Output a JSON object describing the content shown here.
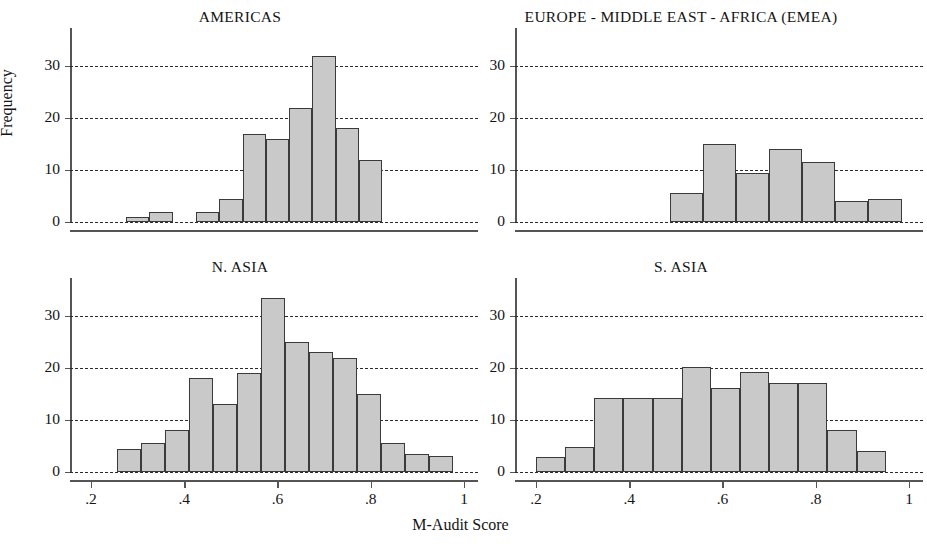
{
  "figure": {
    "xlabel": "M-Audit Score",
    "ylabel": "Frequency"
  },
  "axes": {
    "y_ticks": [
      "0",
      "10",
      "20",
      "30"
    ],
    "x_ticks": [
      ".2",
      ".4",
      ".6",
      ".8",
      "1"
    ],
    "y_tick_values": [
      0,
      10,
      20,
      30
    ],
    "x_tick_values": [
      0.2,
      0.4,
      0.6,
      0.8,
      1.0
    ],
    "ylim": [
      0,
      35
    ],
    "xlim": [
      0.155,
      1.03
    ],
    "grid": "horizontal-dashed",
    "legend": "none"
  },
  "style": {
    "bar_fill": "#c9c9c9",
    "bar_border": "#3a3a3a",
    "grid_color": "#2a2a2a",
    "axis_color": "#555555",
    "text_color": "#141414",
    "background": "#ffffff"
  },
  "chart_data": [
    {
      "type": "bar",
      "title": "AMERICAS",
      "xlabel": "M-Audit Score",
      "ylabel": "Frequency",
      "ylim": [
        0,
        35
      ],
      "xlim": [
        0.155,
        1.03
      ],
      "bin_width": 0.05,
      "bin_starts": [
        0.275,
        0.325,
        0.375,
        0.425,
        0.475,
        0.525,
        0.575,
        0.625,
        0.675,
        0.725,
        0.775
      ],
      "categories": [
        "0.275-0.325",
        "0.325-0.375",
        "0.375-0.425",
        "0.425-0.475",
        "0.475-0.525",
        "0.525-0.575",
        "0.575-0.625",
        "0.625-0.675",
        "0.675-0.725",
        "0.725-0.775",
        "0.775-0.825"
      ],
      "values": [
        1,
        2,
        0,
        2,
        4.5,
        17,
        16,
        22,
        32,
        18,
        12
      ]
    },
    {
      "type": "bar",
      "title": "EUROPE - MIDDLE EAST - AFRICA (EMEA)",
      "xlabel": "M-Audit Score",
      "ylabel": "Frequency",
      "ylim": [
        0,
        35
      ],
      "xlim": [
        0.155,
        1.03
      ],
      "bin_width": 0.071,
      "bin_starts": [
        0.487,
        0.558,
        0.629,
        0.7,
        0.771,
        0.842,
        0.913
      ],
      "categories": [
        "0.49-0.56",
        "0.56-0.63",
        "0.63-0.70",
        "0.70-0.77",
        "0.77-0.84",
        "0.84-0.91",
        "0.91-0.98"
      ],
      "values": [
        5.5,
        15,
        9.5,
        14,
        11.5,
        4,
        4.5
      ]
    },
    {
      "type": "bar",
      "title": "N. ASIA",
      "xlabel": "M-Audit Score",
      "ylabel": "Frequency",
      "ylim": [
        0,
        35
      ],
      "xlim": [
        0.155,
        1.03
      ],
      "bin_width": 0.0515,
      "bin_starts": [
        0.255,
        0.3065,
        0.358,
        0.4095,
        0.461,
        0.5125,
        0.564,
        0.6155,
        0.667,
        0.7185,
        0.77,
        0.8215,
        0.873,
        0.9245
      ],
      "categories": [
        "0.26-0.31",
        "0.31-0.36",
        "0.36-0.41",
        "0.41-0.46",
        "0.46-0.51",
        "0.51-0.56",
        "0.56-0.62",
        "0.62-0.67",
        "0.67-0.72",
        "0.72-0.77",
        "0.77-0.82",
        "0.82-0.87",
        "0.87-0.92",
        "0.92-0.98"
      ],
      "values": [
        4.5,
        5.5,
        8,
        18,
        13,
        19,
        33.5,
        25,
        23,
        22,
        15,
        5.5,
        3.5,
        3
      ]
    },
    {
      "type": "bar",
      "title": "S. ASIA",
      "xlabel": "M-Audit Score",
      "ylabel": "Frequency",
      "ylim": [
        0,
        35
      ],
      "xlim": [
        0.155,
        1.03
      ],
      "bin_width": 0.0625,
      "bin_starts": [
        0.2,
        0.2625,
        0.325,
        0.3875,
        0.45,
        0.5125,
        0.575,
        0.6375,
        0.7,
        0.7625,
        0.825,
        0.8875
      ],
      "categories": [
        "0.20-0.26",
        "0.26-0.33",
        "0.33-0.39",
        "0.39-0.45",
        "0.45-0.51",
        "0.51-0.58",
        "0.58-0.64",
        "0.64-0.70",
        "0.70-0.76",
        "0.76-0.83",
        "0.83-0.89",
        "0.89-0.95"
      ],
      "values": [
        2.8,
        4.8,
        14.3,
        14.3,
        14.3,
        20.2,
        16.2,
        19.3,
        17.2,
        17.2,
        8,
        4
      ]
    }
  ],
  "panels": [
    {
      "title": "AMERICAS"
    },
    {
      "title": "EUROPE - MIDDLE EAST - AFRICA (EMEA)"
    },
    {
      "title": "N. ASIA"
    },
    {
      "title": "S. ASIA"
    }
  ]
}
